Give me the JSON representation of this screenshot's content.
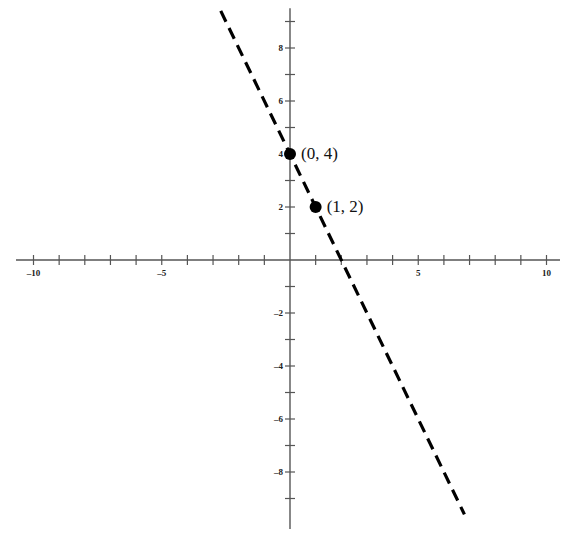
{
  "chart_data": {
    "type": "line",
    "title": "",
    "xlabel": "",
    "ylabel": "",
    "xlim": [
      -10,
      10
    ],
    "ylim": [
      -10,
      9.5
    ],
    "grid": false,
    "legend": null,
    "x_ticks": [
      -10,
      -9,
      -8,
      -7,
      -6,
      -5,
      -4,
      -3,
      -2,
      -1,
      1,
      2,
      3,
      4,
      5,
      6,
      7,
      8,
      9,
      10
    ],
    "x_tick_labels": [
      "-10",
      "-5",
      "5",
      "10"
    ],
    "x_labeled_ticks": [
      -10,
      -5,
      5,
      10
    ],
    "y_ticks": [
      -9,
      -8,
      -7,
      -6,
      -5,
      -4,
      -3,
      -2,
      -1,
      1,
      2,
      3,
      4,
      5,
      6,
      7,
      8,
      9
    ],
    "y_tick_labels": [
      "8",
      "6",
      "4",
      "2",
      "-2",
      "-4",
      "-6",
      "-8"
    ],
    "y_labeled_ticks": [
      8,
      6,
      4,
      2,
      -2,
      -4,
      -6,
      -8
    ],
    "series": [
      {
        "name": "y = -2x + 4",
        "style": "dashed",
        "color": "#000000",
        "slope": -2,
        "intercept": 4,
        "x": [
          -2.7,
          6.8
        ],
        "y": [
          9.4,
          -9.6
        ]
      }
    ],
    "points": [
      {
        "x": 0,
        "y": 4,
        "label": "(0, 4)"
      },
      {
        "x": 1,
        "y": 2,
        "label": "(1, 2)"
      }
    ],
    "annotations": [
      "(0, 4)",
      "(1, 2)"
    ]
  },
  "colors": {
    "axis": "#555555",
    "line": "#000000",
    "point": "#000000",
    "background": "#ffffff"
  }
}
